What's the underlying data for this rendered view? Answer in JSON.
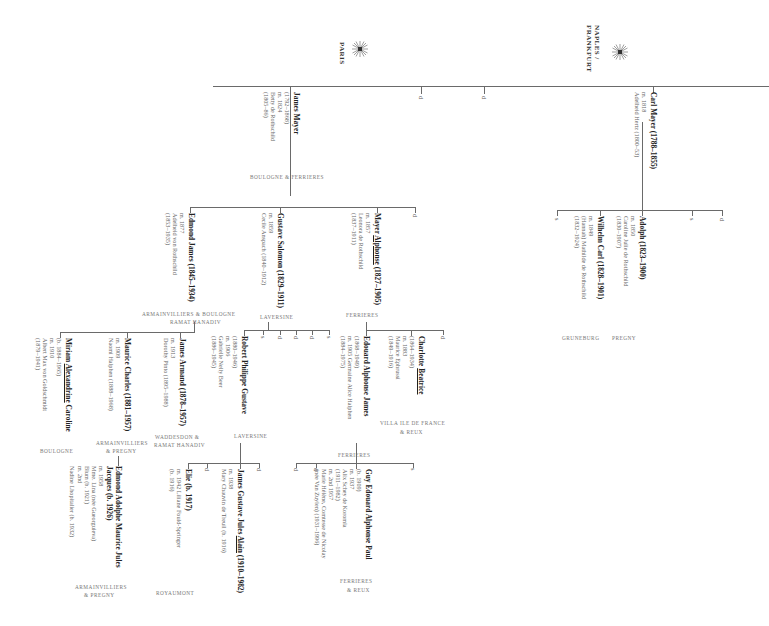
{
  "branches": {
    "naples": {
      "city": "NAPLES / FRANKFURT",
      "line1": "NAPLES /",
      "line2": "FRANKFURT",
      "crest": "sunburst-crest-icon"
    },
    "paris": {
      "city": "PARIS",
      "crest": "sunburst-crest-icon"
    }
  },
  "people": {
    "carl": {
      "name": "Carl Mayer (1788–1855)",
      "marriage": "m. 1818",
      "spouse": "Adelheid Hertz (1800–53)"
    },
    "adolph": {
      "name": "Adolph (1823–1900)",
      "marriage": "m. 1850",
      "spouse": "Caroline Julie de Rothschild",
      "spouse_dates": "(1830–1907)",
      "place": "PREGNY"
    },
    "wilhelm": {
      "name": "Wilhelm Carl (1828–1901)",
      "marriage": "m. 1849",
      "spouse": "(Hannah) Mathilde de Rothschild",
      "spouse_dates": "(1832–1924)",
      "place": "GRUNEBURG"
    },
    "james": {
      "name": "James Mayer",
      "dates": "(1792–1868)",
      "marriage": "m. 1824",
      "spouse": "Betty de Rothschild",
      "spouse_dates": "(1805–86)",
      "place": "BOULOGNE  & FERRIERES"
    },
    "edmond": {
      "name": "Edmond James (1845–1934)",
      "marriage": "m. 1877",
      "spouse": "Adelheid von Rothschild",
      "spouse_dates": "(1853–1935)",
      "place1": "ARMAINVILLIERS & BOULOGNE",
      "place2": "RAMAT HANADIV"
    },
    "gustave": {
      "name": "Gustave Salomon (1829–1911)",
      "marriage": "m. 1859",
      "spouse": "Cecile Anspach (1840–1912)",
      "place": "LAVERSINE"
    },
    "alphonse": {
      "name": "Mayer Alphonse (1827–1905)",
      "marriage": "m. 1857",
      "spouse": "Leonora de Rothschild",
      "spouse_dates": "(1837–1911)",
      "place": "FERRIERES"
    },
    "miriam": {
      "name": "Miriam Alexandrine Caroline",
      "dates": "(b. 1884–1965)",
      "marriage": "m. 1910",
      "spouse": "Albert Max von Goldschmidt",
      "spouse_dates": "(1879–1941)",
      "place": "BOULOGNE"
    },
    "maurice": {
      "name": "Maurice Charles (1881–1957)",
      "marriage": "m. 1909",
      "spouse": "Naomi Halphen (1888–1968)",
      "place1": "ARMAINVILLIERS",
      "place2": "& PREGNY"
    },
    "jamesarmand": {
      "name": "James Armand (1878–1957)",
      "marriage": "m. 1913",
      "spouse": "Dorothy Pinto (1895–1988)",
      "place1": "WADDESDON &",
      "place2": "RAMAT HANADIV"
    },
    "robert": {
      "name": "Robert Philippe Gustave",
      "dates": "(1880–1946)",
      "marriage": "m. 1906",
      "spouse": "Gabrielle Nelly Beer",
      "spouse_dates": "(1886–1945)",
      "place": "LAVERSINE"
    },
    "edouard": {
      "name": "Edouard Alphonse James",
      "dates": "(1868–1949)",
      "marriage": "m. 1905 Germaine Alice Halphen",
      "spouse_dates": "(1884–1975)",
      "place": "FERRIERES"
    },
    "charlotte": {
      "name": "Charlotte Beatrice",
      "dates": "(1864–1934)",
      "marriage": "m. 1883",
      "spouse": "Maurice Ephrussi",
      "spouse_dates": "(1849–1916)",
      "place1": "VILLA ILE DE FRANCE",
      "place2": "& REUX"
    },
    "edmondadolphe": {
      "name": "Edmond Adolphe Maurice Jules",
      "name2": "Jacques (b. 1926)",
      "marriage": "m. 1958",
      "spouse": "Mme. Lina (née Gueorguieva)",
      "spouse2": "Blum (b. 1921)",
      "marriage2": "m. 2nd",
      "spouse3": "Nadine Lhopitalier (b. 1932)",
      "place1": "ARMAINVILLIERS",
      "place2": "& PREGNY"
    },
    "elie": {
      "name": "Elie (b. 1917)",
      "marriage": "m. 1942 Liliane Fould-Springer",
      "spouse_dates": "(b. 1916)"
    },
    "alain": {
      "name": "James Gustave Jules Alain (1910–1982)",
      "marriage": "m. 1938",
      "spouse": "Mary Chauvin de Treuil (b. 1916)",
      "place": "ROYAUMONT"
    },
    "guy": {
      "name": "Guy Edouard Alphonse Paul",
      "dates": "(b. 1909)",
      "marriage": "m. 1937",
      "spouse": "Alix Schey de Koromla",
      "spouse_dates": "(1911–1982)",
      "marriage2": "m. 2nd 1957",
      "spouse2": "Marie Hélène, Comtesse de Nicolay",
      "spouse2b": "(née Van Zuylen) (1931–1996)",
      "place1": "FERRIERES",
      "place2": "& REUX"
    }
  },
  "marks": {
    "d": "d",
    "s": "s"
  }
}
